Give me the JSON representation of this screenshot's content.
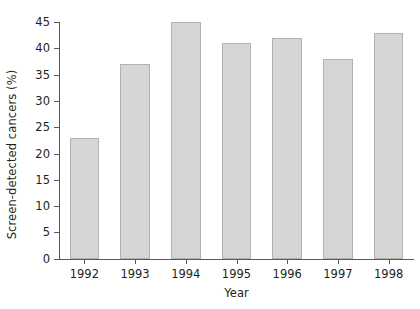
{
  "chart_data": {
    "type": "bar",
    "title": "",
    "xlabel": "Year",
    "ylabel": "Screen-detected cancers (%)",
    "categories": [
      "1992",
      "1993",
      "1994",
      "1995",
      "1996",
      "1997",
      "1998"
    ],
    "values": [
      23,
      37,
      45,
      41,
      42,
      38,
      43
    ],
    "ylim": [
      0,
      45
    ],
    "ytick_values": [
      0,
      5,
      10,
      15,
      20,
      25,
      30,
      35,
      40,
      45
    ],
    "ytick_labels": [
      "0",
      "5",
      "10",
      "15",
      "20",
      "25",
      "30",
      "35",
      "40",
      "45"
    ],
    "grid": false,
    "legend": null,
    "bar_color": "#d6d6d4",
    "bar_edge_color": "#b2b2b0",
    "axis_color": "#58595b",
    "background_color": "#ffffff"
  }
}
